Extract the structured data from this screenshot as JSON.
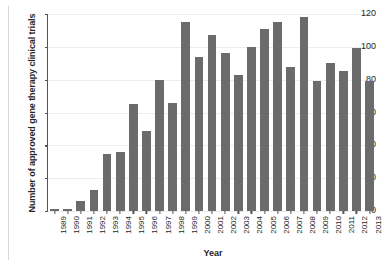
{
  "chart_data": {
    "type": "bar",
    "title": "",
    "xlabel": "Year",
    "ylabel": "Number of approved gene therapy clinical trials",
    "categories": [
      "1989",
      "1990",
      "1991",
      "1992",
      "1993",
      "1994",
      "1995",
      "1996",
      "1997",
      "1998",
      "1999",
      "2000",
      "2001",
      "2002",
      "2003",
      "2004",
      "2005",
      "2006",
      "2007",
      "2008",
      "2009",
      "2010",
      "2011",
      "2012",
      "2013"
    ],
    "values": [
      1,
      1,
      6,
      13,
      35,
      36,
      65,
      49,
      80,
      66,
      115,
      94,
      107,
      96,
      83,
      100,
      111,
      115,
      88,
      118,
      79,
      90,
      85,
      99,
      79
    ],
    "ylim": [
      0,
      120
    ],
    "yticks": [
      0,
      20,
      40,
      60,
      80,
      100,
      120
    ],
    "ytick_labels": [
      "0",
      "20",
      "40",
      "60",
      "80",
      "100",
      "120"
    ],
    "grid": true,
    "legend": false,
    "bar_color": "#6b6b6b",
    "axis_color": "#555555",
    "grid_color": "#ececec",
    "background": "#ffffff"
  }
}
